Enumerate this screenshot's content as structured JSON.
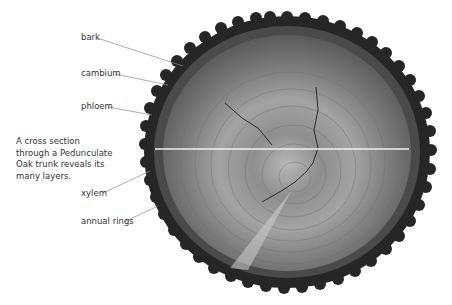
{
  "caption": {
    "lines": [
      "A cross section",
      "through a Pedunculate",
      "Oak trunk reveals its",
      "many layers."
    ]
  },
  "labels": {
    "bark": "bark",
    "cambium": "cambium",
    "phloem": "phloem",
    "xylem": "xylem",
    "annual_rings": "annual rings"
  },
  "colors": {
    "leader_line": "#8a8a8a",
    "text": "#333333",
    "bark": "#2a2a2a",
    "wood": "#8c8c8c",
    "diameter_line": "#f0f0f0"
  }
}
